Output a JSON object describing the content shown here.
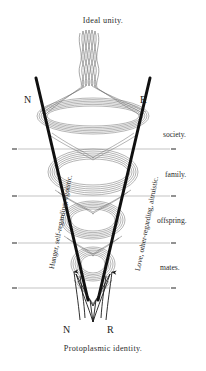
{
  "figure": {
    "title": "Ideal unity.",
    "caption": "Protoplasmic identity.",
    "nodes": {
      "top_left": "N",
      "top_right": "R",
      "bottom_left": "N",
      "bottom_right": "R"
    },
    "stage_labels": [
      {
        "id": "society",
        "text": "society."
      },
      {
        "id": "family",
        "text": "family."
      },
      {
        "id": "offspring",
        "text": "offspring."
      },
      {
        "id": "mates",
        "text": "mates."
      }
    ],
    "axis_labels": {
      "left": "Hunger, self-regarding, egoistic.",
      "right": "Love, other-regarding, altruistic."
    },
    "colors": {
      "ink": "#1a1a1a",
      "strand": "#6f6f6f",
      "rule": "#8a8a8a",
      "background": "#ffffff"
    }
  }
}
